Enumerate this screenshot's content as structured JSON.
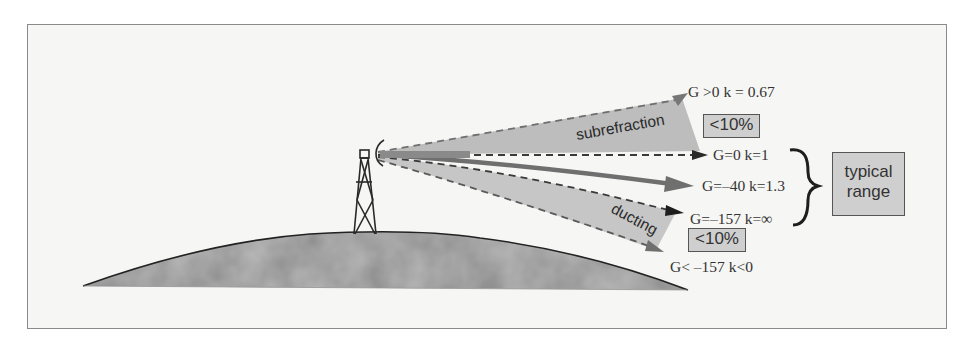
{
  "diagram": {
    "title": "",
    "colors": {
      "frame_border": "#8a8a8a",
      "background": "#f6f6f4",
      "beam_fill": "#bdbdbd",
      "arrow_dark": "#6f6f6f",
      "terrain": "#8c8c8c",
      "label_box": "#cfcfcf",
      "text": "#333333"
    },
    "regions": {
      "subrefraction": {
        "label": "subrefraction",
        "percent_label": "<10%"
      },
      "ducting": {
        "label": "ducting",
        "percent_label": "<10%"
      }
    },
    "rays": [
      {
        "label": "G >0  k = 0.67"
      },
      {
        "label": "G=0  k=1"
      },
      {
        "label": "G=–40  k=1.3"
      },
      {
        "label": "G=–157  k=∞"
      },
      {
        "label": "G< –157  k<0"
      }
    ],
    "typical_range": {
      "line1": "typical",
      "line2": "range"
    },
    "icons": {
      "tower": "lattice-tower-icon",
      "antenna": "antenna-dish-icon",
      "terrain": "earth-surface-hill"
    }
  }
}
